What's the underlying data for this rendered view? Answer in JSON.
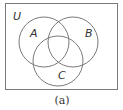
{
  "diagram": {
    "type": "venn",
    "universe_label": "U",
    "sets": [
      {
        "id": "A",
        "label": "A"
      },
      {
        "id": "B",
        "label": "B"
      },
      {
        "id": "C",
        "label": "C"
      }
    ],
    "caption": "(a)",
    "colors": {
      "stroke": "#7a7a7a",
      "text": "#333333",
      "background": "#ffffff"
    }
  }
}
